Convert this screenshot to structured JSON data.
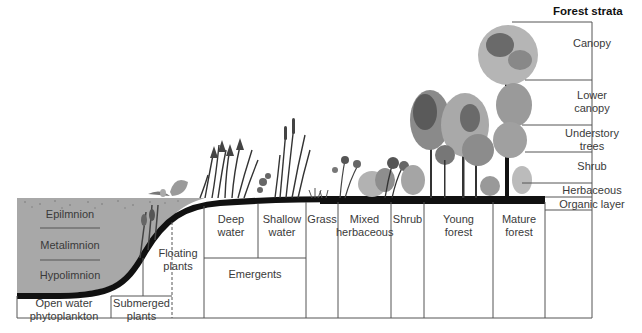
{
  "title": "Forest strata",
  "lake": {
    "layers": [
      "Epilmnion",
      "Metalimnion",
      "Hypolimnion"
    ]
  },
  "zones": [
    {
      "id": "open-water",
      "label": "Open water\nphytoplankton"
    },
    {
      "id": "submerged",
      "label": "Submerged\nplants"
    },
    {
      "id": "floating",
      "label": "Floating\nplants"
    },
    {
      "id": "deep-water",
      "label": "Deep\nwater"
    },
    {
      "id": "shallow-water",
      "label": "Shallow\nwater"
    },
    {
      "id": "emergents",
      "label": "Emergents"
    },
    {
      "id": "grass",
      "label": "Grass"
    },
    {
      "id": "mixed-herbaceous",
      "label": "Mixed\nherbaceous"
    },
    {
      "id": "shrub",
      "label": "Shrub"
    },
    {
      "id": "young-forest",
      "label": "Young\nforest"
    },
    {
      "id": "mature-forest",
      "label": "Mature\nforest"
    }
  ],
  "strata": [
    {
      "id": "canopy",
      "label": "Canopy"
    },
    {
      "id": "lower-canopy",
      "label": "Lower\ncanopy"
    },
    {
      "id": "understory-trees",
      "label": "Understory\ntrees"
    },
    {
      "id": "shrub",
      "label": "Shrub"
    },
    {
      "id": "herbaceous",
      "label": "Herbaceous"
    },
    {
      "id": "organic-layer",
      "label": "Organic layer"
    }
  ],
  "colors": {
    "water": "#a9a9a9",
    "ground": "#111111",
    "line": "#555555",
    "foliage_light": "#b5b5b5",
    "foliage_mid": "#8a8a8a",
    "foliage_dark": "#3c3c3c"
  }
}
